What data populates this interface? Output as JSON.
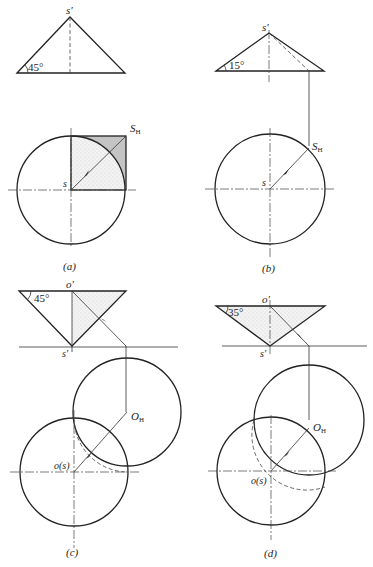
{
  "figure": {
    "panels": [
      {
        "id": "a",
        "caption": "(a)",
        "angle_label": "45°",
        "apex_label": "s′",
        "center_label": "s",
        "shadow_label": "S",
        "shadow_subscript": "H"
      },
      {
        "id": "b",
        "caption": "(b)",
        "angle_label": "15°",
        "apex_label": "s′",
        "center_label": "s",
        "shadow_label": "S",
        "shadow_subscript": "H"
      },
      {
        "id": "c",
        "caption": "(c)",
        "angle_label": "45°",
        "top_label": "o′",
        "apex_label": "s′",
        "center_label": "o(s)",
        "shadow_label": "O",
        "shadow_subscript": "H"
      },
      {
        "id": "d",
        "caption": "(d)",
        "angle_label": "35°",
        "top_label": "o′",
        "apex_label": "s′",
        "center_label": "o(s)",
        "shadow_label": "O",
        "shadow_subscript": "H"
      }
    ],
    "colors": {
      "line": "#222222",
      "shadow_fill": "#c8c8c8",
      "light_fill": "#ececec"
    }
  }
}
